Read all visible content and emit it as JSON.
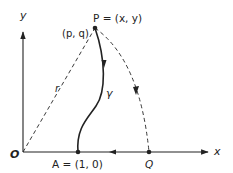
{
  "diagram": {
    "axes": {
      "x_label": "x",
      "y_label": "y"
    },
    "points": {
      "origin": {
        "label": "O"
      },
      "A": {
        "label": "A = (1, 0)"
      },
      "P": {
        "label": "P = (x, y)"
      },
      "Q": {
        "label": "Q"
      },
      "pq": {
        "label": "(p, q)"
      }
    },
    "curves": {
      "radius": {
        "label": "r"
      },
      "gamma": {
        "label": "γ"
      }
    },
    "colors": {
      "ink": "#222222",
      "background": "#ffffff"
    }
  }
}
